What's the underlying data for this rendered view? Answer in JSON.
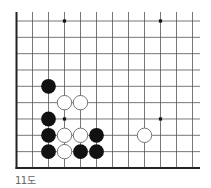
{
  "diagram": {
    "caption": "11도",
    "type": "go-board-fragment",
    "visible_columns": 12,
    "visible_rows": 10,
    "edges": [
      "left",
      "bottom"
    ],
    "colors": {
      "line": "#555555",
      "edge": "#222222",
      "black_stone": "#111111",
      "white_stone": "#ffffff",
      "white_stone_border": "#555555",
      "star_point": "#111111",
      "caption": "#666666"
    },
    "star_points": [
      {
        "col": 3,
        "row": 0
      },
      {
        "col": 9,
        "row": 0
      },
      {
        "col": 3,
        "row": 6
      },
      {
        "col": 9,
        "row": 6
      }
    ],
    "stones": [
      {
        "color": "black",
        "col": 2,
        "row": 4
      },
      {
        "color": "white",
        "col": 3,
        "row": 5
      },
      {
        "color": "white",
        "col": 4,
        "row": 5
      },
      {
        "color": "black",
        "col": 2,
        "row": 6
      },
      {
        "color": "black",
        "col": 2,
        "row": 7
      },
      {
        "color": "white",
        "col": 3,
        "row": 7
      },
      {
        "color": "white",
        "col": 4,
        "row": 7
      },
      {
        "color": "black",
        "col": 5,
        "row": 7
      },
      {
        "color": "white",
        "col": 8,
        "row": 7
      },
      {
        "color": "black",
        "col": 2,
        "row": 8
      },
      {
        "color": "white",
        "col": 3,
        "row": 8
      },
      {
        "color": "black",
        "col": 4,
        "row": 8
      },
      {
        "color": "black",
        "col": 5,
        "row": 8
      }
    ]
  }
}
